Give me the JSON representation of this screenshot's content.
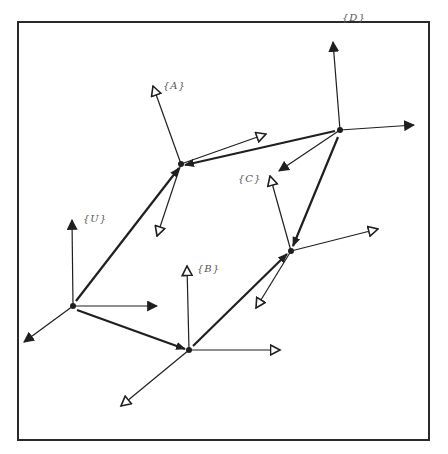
{
  "diagram": {
    "border": {
      "x1": 18,
      "y1": 22,
      "x2": 429,
      "y2": 440,
      "color": "#2a2a2a"
    },
    "colors": {
      "ink": "#1f1f1f",
      "label": "#555555"
    },
    "frames": [
      {
        "id": "U",
        "label": "{U}",
        "origin": [
          73,
          306
        ],
        "head_style": "solid",
        "label_pos": [
          83,
          214
        ],
        "axes": [
          [
            72,
            220
          ],
          [
            157,
            306
          ],
          [
            24,
            342
          ]
        ]
      },
      {
        "id": "A",
        "label": "{A}",
        "origin": [
          181,
          164
        ],
        "head_style": "hollow",
        "label_pos": [
          163,
          81
        ],
        "axes": [
          [
            153,
            86
          ],
          [
            266,
            134
          ],
          [
            157,
            236
          ]
        ]
      },
      {
        "id": "B",
        "label": "{B}",
        "origin": [
          189,
          350
        ],
        "head_style": "hollow",
        "label_pos": [
          197,
          264
        ],
        "axes": [
          [
            187,
            266
          ],
          [
            280,
            350
          ],
          [
            121,
            406
          ]
        ]
      },
      {
        "id": "C",
        "label": "{C}",
        "origin": [
          291,
          251
        ],
        "head_style": "hollow",
        "label_pos": [
          238,
          174
        ],
        "axes": [
          [
            270,
            176
          ],
          [
            378,
            229
          ],
          [
            256,
            308
          ]
        ]
      },
      {
        "id": "D",
        "label": "{D}",
        "origin": [
          340,
          130
        ],
        "head_style": "solid",
        "label_pos": [
          342,
          13
        ],
        "axes": [
          [
            333,
            42
          ],
          [
            414,
            125
          ],
          [
            279,
            171
          ]
        ]
      }
    ],
    "transforms": [
      {
        "from": "U",
        "to": "A",
        "start": [
          76,
          301
        ],
        "end": [
          179,
          168
        ]
      },
      {
        "from": "U",
        "to": "B",
        "start": [
          77,
          310
        ],
        "end": [
          185,
          349
        ]
      },
      {
        "from": "D",
        "to": "A",
        "start": [
          335,
          131
        ],
        "end": [
          185,
          165
        ]
      },
      {
        "from": "D",
        "to": "C",
        "start": [
          338,
          137
        ],
        "end": [
          293,
          246
        ]
      },
      {
        "from": "B",
        "to": "C",
        "start": [
          193,
          346
        ],
        "end": [
          287,
          254
        ]
      }
    ]
  }
}
